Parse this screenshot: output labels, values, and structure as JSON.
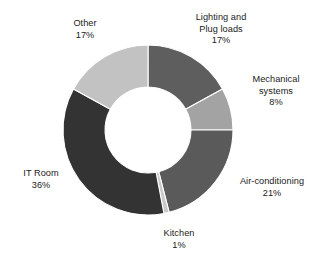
{
  "chart_data": {
    "type": "pie",
    "variant": "donut",
    "title": "",
    "subtitle": "",
    "xlabel": "",
    "ylabel": "",
    "legend_position": "none",
    "grid": false,
    "unit": "%",
    "total": 100,
    "start_angle_deg": 0,
    "direction": "clockwise",
    "inner_radius_ratio": 0.5,
    "categories": [
      "Lighting and Plug loads",
      "Mechanical systems",
      "Air-conditioning",
      "Kitchen",
      "IT Room",
      "Other"
    ],
    "values": [
      17,
      8,
      21,
      1,
      36,
      17
    ],
    "colors": [
      "#5e5e5e",
      "#a3a3a3",
      "#5a5a5a",
      "#c9c9c9",
      "#333333",
      "#c2c2c2"
    ],
    "slices": [
      {
        "label": "Lighting and Plug loads",
        "label_line1": "Lighting and",
        "label_line2": "Plug loads",
        "value": 17,
        "value_text": "17%",
        "color": "#5e5e5e"
      },
      {
        "label": "Mechanical systems",
        "label_line1": "Mechanical",
        "label_line2": "systems",
        "value": 8,
        "value_text": "8%",
        "color": "#a3a3a3"
      },
      {
        "label": "Air-conditioning",
        "label_line1": "Air-conditioning",
        "label_line2": "",
        "value": 21,
        "value_text": "21%",
        "color": "#5a5a5a"
      },
      {
        "label": "Kitchen",
        "label_line1": "Kitchen",
        "label_line2": "",
        "value": 1,
        "value_text": "1%",
        "color": "#c9c9c9"
      },
      {
        "label": "IT Room",
        "label_line1": "IT Room",
        "label_line2": "",
        "value": 36,
        "value_text": "36%",
        "color": "#333333"
      },
      {
        "label": "Other",
        "label_line1": "Other",
        "label_line2": "",
        "value": 17,
        "value_text": "17%",
        "color": "#c2c2c2"
      }
    ]
  },
  "geometry": {
    "cx": 148,
    "cy": 130,
    "outer_radius": 85,
    "inner_radius": 43
  },
  "style": {
    "background": "#ffffff",
    "label_color": "#1a1a1a"
  }
}
